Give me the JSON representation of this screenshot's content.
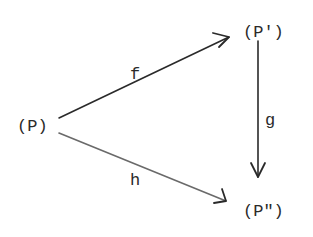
{
  "diagram": {
    "type": "commutative-diagram",
    "nodes": [
      {
        "id": "P",
        "label": "(P)"
      },
      {
        "id": "P1",
        "label": "(P')"
      },
      {
        "id": "P2",
        "label": "(P\")"
      }
    ],
    "edges": [
      {
        "id": "f",
        "from": "P",
        "to": "P1",
        "label": "f"
      },
      {
        "id": "g",
        "from": "P1",
        "to": "P2",
        "label": "g"
      },
      {
        "id": "h",
        "from": "P",
        "to": "P2",
        "label": "h"
      }
    ],
    "colors": {
      "ink": "#2a2a2a",
      "background": "#ffffff"
    }
  }
}
